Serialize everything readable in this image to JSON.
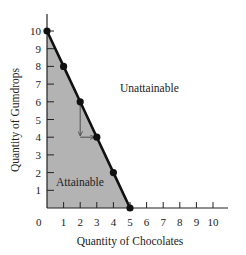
{
  "chart_data": {
    "type": "line",
    "title": "",
    "xlabel": "Quantity of Chocolates",
    "ylabel": "Quantity of Gumdrops",
    "xlim": [
      0,
      10
    ],
    "ylim": [
      0,
      10
    ],
    "grid": false,
    "x_ticks": [
      0,
      1,
      2,
      3,
      4,
      5,
      6,
      7,
      8,
      9,
      10
    ],
    "y_ticks": [
      1,
      2,
      3,
      4,
      5,
      6,
      7,
      8,
      9,
      10
    ],
    "series": [
      {
        "name": "Production possibilities frontier",
        "x": [
          0,
          1,
          2,
          3,
          4,
          5
        ],
        "y": [
          10,
          8,
          6,
          4,
          2,
          0
        ],
        "markers": true
      }
    ],
    "shaded_region": {
      "label": "Attainable",
      "fill": "#b3b3b3",
      "vertices": [
        [
          0,
          0
        ],
        [
          0,
          10
        ],
        [
          5,
          0
        ]
      ]
    },
    "annotations": [
      {
        "text": "Unattainable",
        "x": 5.4,
        "y": 7.0
      },
      {
        "text": "Attainable",
        "x": 0.6,
        "y": 1.4
      },
      {
        "type": "arrow",
        "path": [
          [
            2,
            6
          ],
          [
            2,
            4
          ],
          [
            3,
            4
          ]
        ]
      }
    ],
    "colors": {
      "line": "#111111",
      "fill": "#b3b3b3",
      "axis": "#222222"
    }
  },
  "labels": {
    "xlabel": "Quantity of Chocolates",
    "ylabel": "Quantity of Gumdrops",
    "unattainable": "Unattainable",
    "attainable": "Attainable",
    "origin": "0"
  }
}
